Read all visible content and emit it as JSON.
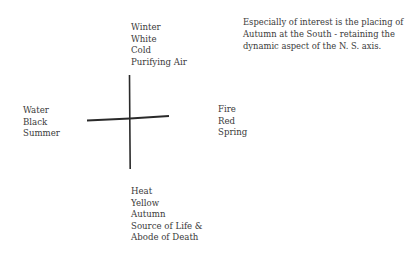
{
  "diagram": {
    "north": {
      "lines": [
        "Winter",
        "White",
        "Cold",
        "Purifying Air"
      ]
    },
    "west": {
      "lines": [
        "Water",
        "Black",
        "Summer"
      ]
    },
    "east": {
      "lines": [
        "Fire",
        "Red",
        "Spring"
      ]
    },
    "south": {
      "lines": [
        "Heat",
        "Yellow",
        "Autumn",
        "Source of Life &",
        "Abode of Death"
      ]
    },
    "note": {
      "lines": [
        "Especially of interest is the placing of",
        "Autumn at the South - retaining the",
        "dynamic aspect of the N. S. axis."
      ]
    },
    "cross_color": "#2a2a2a"
  }
}
